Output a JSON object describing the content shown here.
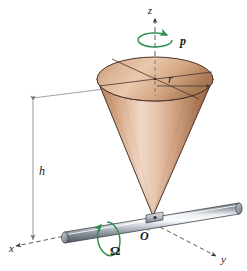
{
  "figure": {
    "background_color": "#ffffff"
  },
  "labels": {
    "z_axis": "z",
    "x_axis": "x",
    "y_axis": "y",
    "origin": "O",
    "spin_rate": "p",
    "precession_rate": "Ω",
    "height": "h",
    "radius": "r"
  },
  "colors": {
    "cone_light": "#f0d9c9",
    "cone_mid": "#d8a989",
    "cone_dark": "#9d6443",
    "cone_outline": "#4a3328",
    "rod_light": "#f2f4f6",
    "rod_mid": "#a8adb4",
    "rod_dark": "#5b6169",
    "rod_outline": "#3d4249",
    "arrow_green": "#2f8f4e",
    "axis_line": "#4a4a4a",
    "dimension_line": "#8a8a8a",
    "text": "#1a1a1a"
  },
  "geometry": {
    "cone_apex": {
      "x": 153,
      "y": 216
    },
    "cone_base_center": {
      "x": 155,
      "y": 79
    },
    "cone_base_rx": 58,
    "cone_base_ry": 22,
    "rod_left_end": {
      "x": 64,
      "y": 237
    },
    "rod_right_end": {
      "x": 238,
      "y": 208
    },
    "rod_radius": 6,
    "height_dim_x": 33,
    "height_dim_top_y": 97,
    "height_dim_bottom_y": 243,
    "radius_arrow_from": {
      "x": 158,
      "y": 86
    },
    "radius_arrow_to": {
      "x": 207,
      "y": 86
    }
  },
  "elements": {
    "z_axis_style": "dashed-with-arrowhead",
    "x_axis_style": "dashed",
    "y_axis_style": "dashed",
    "spin_arrow_style": "circular-green-ccw",
    "precession_arrow_style": "circular-green-ccw",
    "height_dim_style": "double-headed-arrow",
    "radius_dim_style": "single-headed-arrow"
  }
}
